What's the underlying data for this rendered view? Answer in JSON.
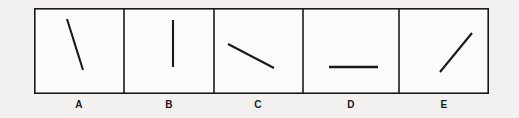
{
  "figure": {
    "name": "line-orientation-choice-panels",
    "background_color": "#f2f1f0",
    "ink_color": "#1a1a1a",
    "frame": {
      "x": 34,
      "y": 8,
      "width": 455,
      "height": 86,
      "stroke_width": 1.6
    },
    "dividers_x": [
      124,
      214,
      303,
      399
    ],
    "panels": [
      {
        "id": "A",
        "label": "A",
        "box": {
          "x": 34,
          "y": 8,
          "width": 90,
          "height": 86
        },
        "label_center_x": 79,
        "label_y": 99,
        "line": {
          "x1": 67,
          "y1": 19,
          "x2": 83,
          "y2": 70,
          "stroke_width": 2.1
        },
        "orientation": "steep-down-right",
        "angle_degrees": -72
      },
      {
        "id": "B",
        "label": "B",
        "box": {
          "x": 124,
          "y": 8,
          "width": 90,
          "height": 86
        },
        "label_center_x": 169,
        "label_y": 99,
        "line": {
          "x1": 173,
          "y1": 20,
          "x2": 173,
          "y2": 67,
          "stroke_width": 2.1
        },
        "orientation": "vertical",
        "angle_degrees": 90
      },
      {
        "id": "C",
        "label": "C",
        "box": {
          "x": 214,
          "y": 8,
          "width": 89,
          "height": 86
        },
        "label_center_x": 258,
        "label_y": 99,
        "line": {
          "x1": 228,
          "y1": 44,
          "x2": 274,
          "y2": 68,
          "stroke_width": 2.1
        },
        "orientation": "shallow-down-right",
        "angle_degrees": -27
      },
      {
        "id": "D",
        "label": "D",
        "box": {
          "x": 303,
          "y": 8,
          "width": 96,
          "height": 86
        },
        "label_center_x": 351,
        "label_y": 99,
        "line": {
          "x1": 329,
          "y1": 67,
          "x2": 378,
          "y2": 67,
          "stroke_width": 2.4
        },
        "orientation": "horizontal",
        "angle_degrees": 0
      },
      {
        "id": "E",
        "label": "E",
        "box": {
          "x": 399,
          "y": 8,
          "width": 90,
          "height": 86
        },
        "label_center_x": 444,
        "label_y": 99,
        "line": {
          "x1": 440,
          "y1": 72,
          "x2": 472,
          "y2": 33,
          "stroke_width": 2.1
        },
        "orientation": "up-right-diagonal",
        "angle_degrees": 51
      }
    ]
  }
}
